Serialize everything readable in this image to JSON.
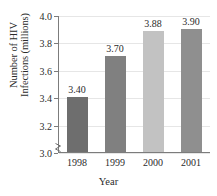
{
  "chart_data": {
    "type": "bar",
    "title": "",
    "xlabel": "Year",
    "ylabel_lines": [
      "Number of HIV",
      "Infections (millions)"
    ],
    "ylabel": "Number of HIV Infections (millions)",
    "categories": [
      "1998",
      "1999",
      "2000",
      "2001"
    ],
    "values": [
      3.4,
      3.7,
      3.88,
      3.9
    ],
    "value_labels": [
      "3.40",
      "3.70",
      "3.88",
      "3.90"
    ],
    "bar_colors": [
      "#6e6e6e",
      "#808080",
      "#c2c2c2",
      "#8f8f8f"
    ],
    "ylim": [
      3.0,
      4.0
    ],
    "yticks": [
      4.0,
      3.8,
      3.6,
      3.4,
      3.2,
      3.0
    ],
    "ytick_labels": [
      "4.0",
      "3.8",
      "3.6",
      "3.4",
      "3.2",
      "3.0"
    ],
    "grid": true,
    "legend": "none",
    "axis_break": true
  }
}
